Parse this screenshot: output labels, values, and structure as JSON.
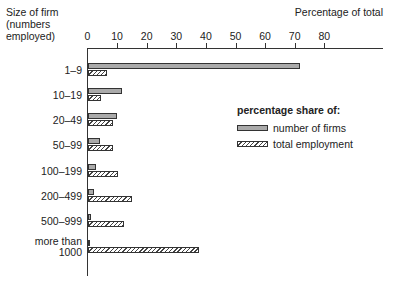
{
  "chart_data": {
    "type": "bar",
    "orientation": "horizontal",
    "title": "",
    "xlabel": "Percentage of total",
    "ylabel": "Size of firm (numbers employed)",
    "ylabel_lines": [
      "Size of firm",
      "(numbers",
      "employed)"
    ],
    "xlim": [
      0,
      100
    ],
    "xticks": [
      0,
      10,
      20,
      30,
      40,
      50,
      60,
      70,
      80
    ],
    "categories": [
      "1–9",
      "10–19",
      "20–49",
      "50–99",
      "100–199",
      "200–499",
      "500–999",
      "more than 1000"
    ],
    "series": [
      {
        "name": "number of firms",
        "values": [
          71.5,
          11.5,
          9.7,
          4.0,
          2.8,
          2.0,
          1.0,
          0.5
        ]
      },
      {
        "name": "total employment",
        "values": [
          6.4,
          4.5,
          8.6,
          8.6,
          10.3,
          15.0,
          12.0,
          37.5
        ]
      }
    ],
    "legend_title": "percentage share of:",
    "legend_position": "right-middle",
    "grid": false
  }
}
